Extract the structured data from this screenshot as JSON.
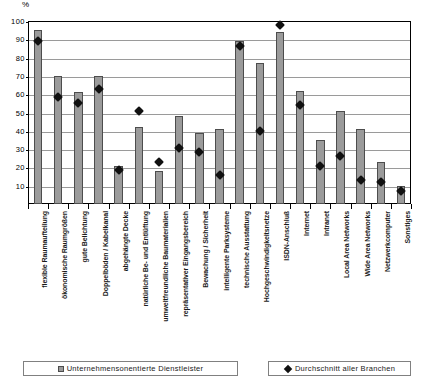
{
  "unit_label": "%",
  "legend": {
    "bars": {
      "label": "Unternehmensonentierte Dienstleister",
      "swatch": "bar-swatch",
      "color": "#9b9b9b"
    },
    "average": {
      "label": "Durchschnitt aller Branchen",
      "swatch": "diamond-marker",
      "color": "#111111"
    }
  },
  "chart_data": {
    "type": "bar",
    "title": "",
    "xlabel": "",
    "ylabel": "%",
    "ylim": [
      0,
      100
    ],
    "yticks": [
      10,
      20,
      30,
      40,
      50,
      60,
      70,
      80,
      90,
      100
    ],
    "grid": true,
    "legend_position": "bottom",
    "categories": [
      "flexible Raumaufteilung",
      "ökonomische Raumgrößen",
      "gute Belichtung",
      "Doppelböden / Kabelkanal",
      "abgehängte Decke",
      "natürliche Be- und Entlüftung",
      "umweltfreundliche Baumaterialien",
      "repräsentativer Eingangsbereich",
      "Bewachung / Sicherheit",
      "intelligente Parksysteme",
      "technische Ausstattung",
      "Hochgeschwindigkeitsnetze",
      "ISDN-Anschluß",
      "Internet",
      "Intranet",
      "Local Area Networks",
      "Wide Area Networks",
      "Netzwerkcomputer",
      "Sonstiges"
    ],
    "series": [
      {
        "name": "Unternehmensonentierte Dienstleister",
        "type": "bar",
        "color": "#9b9b9b",
        "values": [
          95,
          70,
          61,
          70,
          21,
          42,
          18,
          48,
          39,
          41,
          89,
          77,
          94,
          62,
          35,
          51,
          41,
          23,
          10
        ]
      },
      {
        "name": "Durchschnitt aller Branchen",
        "type": "scatter",
        "marker": "diamond",
        "color": "#111111",
        "values": [
          91,
          60.5,
          57,
          64.5,
          20.5,
          52.5,
          25,
          32.5,
          30.5,
          18,
          88,
          42,
          100,
          56,
          22.5,
          28,
          15,
          14,
          9
        ]
      }
    ]
  }
}
